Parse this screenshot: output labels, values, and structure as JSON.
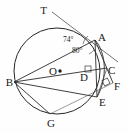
{
  "figure": {
    "kind": "euclidean-geometry-diagram",
    "colors": {
      "stroke": "#2b2b2b",
      "background": "#ffffff",
      "label": "#1a1a1a"
    },
    "circle": {
      "center_label": "O",
      "center_x": 57,
      "center_y": 71,
      "radius": 43,
      "has_center_dot": true
    },
    "points": [
      {
        "label": "T",
        "x": 47,
        "y": 10,
        "anchor": "end",
        "on_circle": false,
        "note": "external point on tangent line"
      },
      {
        "label": "A",
        "x": 96,
        "y": 37,
        "anchor": "start",
        "on_circle": true
      },
      {
        "label": "B",
        "x": 14,
        "y": 81,
        "anchor": "end",
        "on_circle": true
      },
      {
        "label": "C",
        "x": 107,
        "y": 70,
        "anchor": "start",
        "on_circle": false
      },
      {
        "label": "D",
        "x": 89,
        "y": 77,
        "anchor": "end",
        "on_circle": false
      },
      {
        "label": "E",
        "x": 99,
        "y": 98,
        "anchor": "start",
        "on_circle": true
      },
      {
        "label": "F",
        "x": 115,
        "y": 85,
        "anchor": "start",
        "on_circle": false
      },
      {
        "label": "G",
        "x": 50,
        "y": 116,
        "anchor": "middle",
        "on_circle": true
      },
      {
        "label": "O",
        "x": 57,
        "y": 71,
        "anchor": "end",
        "on_circle": false,
        "note": "circle centre"
      }
    ],
    "angles": [
      {
        "label": "74°",
        "value": 74,
        "unit": "degrees",
        "vertex": "A",
        "x": 63,
        "y": 40,
        "note": "angle between tangent TA and chord A-B at A"
      },
      {
        "label": "80°",
        "value": 80,
        "unit": "degrees",
        "vertex": "A",
        "x": 72,
        "y": 51,
        "note": "angle between chord A-B and segment A-E at A"
      }
    ],
    "right_angles": [
      {
        "at": "D",
        "x": 86,
        "y": 67,
        "size": 6,
        "rotation": 0,
        "note": "perpendicular mark at D"
      },
      {
        "at": "F",
        "x": 106,
        "y": 80,
        "size": 6,
        "rotation": -28,
        "note": "perpendicular mark at F"
      }
    ],
    "segments": [
      {
        "from": "T",
        "to": "tangent-end",
        "note": "tangent line through A, extended past A"
      },
      {
        "from": "A",
        "to": "B",
        "note": "chord"
      },
      {
        "from": "A",
        "to": "E",
        "note": "chord through D"
      },
      {
        "from": "A",
        "to": "F",
        "note": "line through C to F"
      },
      {
        "from": "B",
        "to": "C",
        "note": "line through D to C"
      },
      {
        "from": "B",
        "to": "G",
        "note": "chord"
      },
      {
        "from": "B",
        "to": "E",
        "note": "chord through G region"
      },
      {
        "from": "G",
        "to": "F",
        "note": "line from G to F"
      },
      {
        "from": "E",
        "to": "C",
        "note": "short segment"
      },
      {
        "from": "A",
        "to": "C",
        "note": "short segment"
      }
    ],
    "arcs": [
      {
        "from": "A",
        "to": "E",
        "note": "secondary arc bulging right, inside/outside circle near C"
      }
    ]
  }
}
